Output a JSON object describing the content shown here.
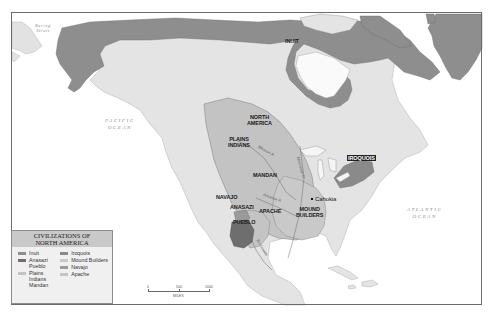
{
  "map": {
    "title": "Civilizations of North America",
    "colors": {
      "water": "#ffffff",
      "land": "#e6e6e6",
      "inuit": "#8e8e8e",
      "plains": "#c3c3c3",
      "anasazi": "#6e6e6e",
      "iroquois": "#8a8a8a",
      "mound": "#c9c9c9",
      "navajo": "#9a9a9a",
      "apache": "#c4c4c4"
    }
  },
  "labels": {
    "bering_strait": "Bering\nStrait",
    "pacific_ocean_1": "PACIFIC",
    "pacific_ocean_2": "OCEAN",
    "atlantic_ocean_1": "ATLANTIC",
    "atlantic_ocean_2": "OCEAN",
    "inuit": "INUIT",
    "north_america_1": "NORTH",
    "north_america_2": "AMERICA",
    "plains_indians_1": "PLAINS",
    "plains_indians_2": "INDIANS",
    "mandan": "MANDAN",
    "iroquois": "IROQUOIS",
    "navajo": "NAVAJO",
    "anasazi": "ANASAZI",
    "pueblo": "PUEBLO",
    "apache": "APACHE",
    "mound_builders_1": "MOUND",
    "mound_builders_2": "BUILDERS",
    "cahokia": "Cahokia",
    "missouri_river": "Missouri R.",
    "mississippi_river": "Mississippi R.",
    "arkansas_river": "Arkansas R.",
    "rio_grande": "Rio Grande"
  },
  "legend": {
    "title_line1": "CIVILIZATIONS OF",
    "title_line2": "NORTH AMERICA",
    "items_left": [
      {
        "label": "Inuit",
        "color": "#8e8e8e"
      },
      {
        "label": "Anasazi\nPueblo",
        "color": "#6e6e6e"
      },
      {
        "label": "Plains\nIndians\nMandan",
        "color": "#c3c3c3"
      }
    ],
    "items_right": [
      {
        "label": "Iroquois",
        "color": "#8a8a8a"
      },
      {
        "label": "Mound Builders",
        "color": "#c9c9c9"
      },
      {
        "label": "Navajo",
        "color": "#9a9a9a"
      },
      {
        "label": "Apache",
        "color": "#c4c4c4"
      }
    ]
  },
  "scale": {
    "ticks": [
      "0",
      "500",
      "1000"
    ],
    "unit": "MILES"
  }
}
